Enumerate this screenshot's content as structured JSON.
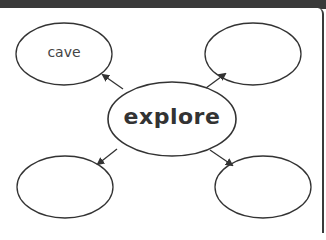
{
  "diagram": {
    "type": "concept-web",
    "center": {
      "label": "explore"
    },
    "nodes": [
      {
        "position": "top-left",
        "label": "cave"
      },
      {
        "position": "top-right",
        "label": ""
      },
      {
        "position": "bottom-left",
        "label": ""
      },
      {
        "position": "bottom-right",
        "label": ""
      }
    ],
    "colors": {
      "stroke": "#333333",
      "topbar": "#3a3a3a",
      "background": "#ffffff"
    }
  }
}
